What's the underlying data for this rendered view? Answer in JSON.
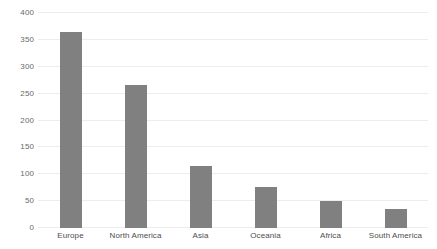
{
  "chart_data": {
    "type": "bar",
    "title": "",
    "xlabel": "",
    "ylabel": "",
    "categories": [
      "Europe",
      "North America",
      "Asia",
      "Oceania",
      "Africa",
      "South America"
    ],
    "values": [
      364,
      267,
      115,
      76,
      51,
      36
    ],
    "ylim": [
      0,
      400
    ],
    "yticks": [
      0,
      50,
      100,
      150,
      200,
      250,
      300,
      350,
      400
    ],
    "ytick_labels": [
      "0",
      "50",
      "100",
      "150",
      "200",
      "250",
      "300",
      "350",
      "400"
    ],
    "grid": true,
    "grid_axis": "y",
    "legend": false,
    "legend_position": "none",
    "bar_color": "#808080",
    "grid_color": "#ededed",
    "background_color": "#ffffff",
    "tick_label_color": "#6a6a6a",
    "category_label_color": "#4d4d4d"
  }
}
